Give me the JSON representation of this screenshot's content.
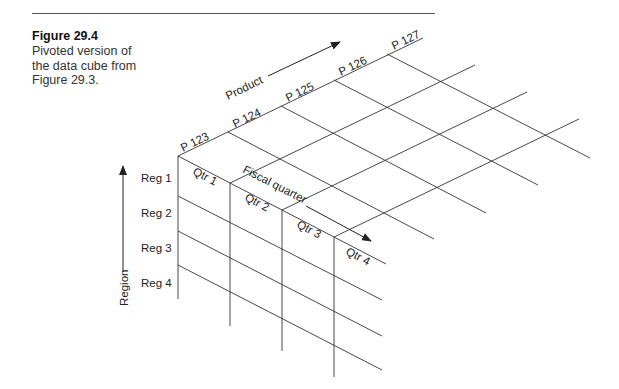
{
  "figure": {
    "title": "Figure 29.4",
    "caption": "Pivoted version of the data cube from Figure 29.3."
  },
  "axes": {
    "product": {
      "label": "Product",
      "items": [
        "P 123",
        "P 124",
        "P 125",
        "P 126",
        "P 127"
      ]
    },
    "quarter": {
      "label": "Fiscal quarter",
      "items": [
        "Qtr 1",
        "Qtr 2",
        "Qtr 3",
        "Qtr 4"
      ]
    },
    "region": {
      "label": "Region",
      "items": [
        "Reg 1",
        "Reg 2",
        "Reg 3",
        "Reg 4"
      ]
    }
  },
  "colors": {
    "line": "#333333",
    "text": "#222222",
    "rule": "#555555"
  }
}
